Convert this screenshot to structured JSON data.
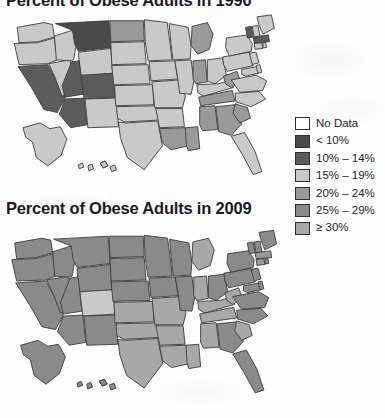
{
  "figure": {
    "maps": [
      {
        "id": "map-1990",
        "title": "Percent of Obese Adults in 1990",
        "year": "1990"
      },
      {
        "id": "map-2009",
        "title": "Percent of Obese Adults in 2009",
        "year": "2009"
      }
    ]
  },
  "legend": {
    "title": "",
    "items": [
      {
        "label": "No Data",
        "color": "#ffffff"
      },
      {
        "label": "< 10%",
        "color": "#4a4a4a"
      },
      {
        "label": "10% – 14%",
        "color": "#5c5c5c"
      },
      {
        "label": "15% – 19%",
        "color": "#c9c9c9"
      },
      {
        "label": "20% – 24%",
        "color": "#9a9a9a"
      },
      {
        "label": "25% – 29%",
        "color": "#8a8a8a"
      },
      {
        "label": "≥ 30%",
        "color": "#a8a8a8"
      }
    ]
  },
  "chart_data": {
    "type": "map",
    "subtitle": "",
    "xlabel": "",
    "ylabel": "",
    "projection": "united-states-choropleth",
    "legend_position": "right",
    "grid": false,
    "categories": [
      "No Data",
      "< 10%",
      "10% – 14%",
      "15% – 19%",
      "20% – 24%",
      "25% – 29%",
      "≥ 30%"
    ],
    "category_colors": [
      "#ffffff",
      "#4a4a4a",
      "#5c5c5c",
      "#c9c9c9",
      "#9a9a9a",
      "#8a8a8a",
      "#a8a8a8"
    ],
    "series": [
      {
        "name": "1990",
        "values": {
          "WA": "15% – 19%",
          "OR": "15% – 19%",
          "CA": "10% – 14%",
          "NV": "15% – 19%",
          "ID": "15% – 19%",
          "MT": "< 10%",
          "WY": "15% – 19%",
          "UT": "10% – 14%",
          "CO": "10% – 14%",
          "AZ": "10% – 14%",
          "NM": "15% – 19%",
          "ND": "20% – 24%",
          "SD": "15% – 19%",
          "NE": "15% – 19%",
          "KS": "15% – 19%",
          "OK": "15% – 19%",
          "TX": "15% – 19%",
          "MN": "15% – 19%",
          "IA": "15% – 19%",
          "MO": "15% – 19%",
          "AR": "15% – 19%",
          "LA": "20% – 24%",
          "WI": "15% – 19%",
          "IL": "15% – 19%",
          "MS": "20% – 24%",
          "MI": "20% – 24%",
          "IN": "20% – 24%",
          "KY": "15% – 19%",
          "TN": "20% – 24%",
          "AL": "20% – 24%",
          "OH": "15% – 19%",
          "WV": "20% – 24%",
          "GA": "20% – 24%",
          "FL": "15% – 19%",
          "SC": "20% – 24%",
          "NC": "15% – 19%",
          "VA": "15% – 19%",
          "PA": "15% – 19%",
          "NY": "15% – 19%",
          "MD": "15% – 19%",
          "DE": "15% – 19%",
          "NJ": "15% – 19%",
          "CT": "15% – 19%",
          "RI": "15% – 19%",
          "MA": "10% – 14%",
          "VT": "10% – 14%",
          "NH": "15% – 19%",
          "ME": "15% – 19%",
          "AK": "15% – 19%",
          "HI": "15% – 19%"
        }
      },
      {
        "name": "2009",
        "values": {
          "WA": "25% – 29%",
          "OR": "25% – 29%",
          "CA": "25% – 29%",
          "NV": "25% – 29%",
          "ID": "25% – 29%",
          "MT": "25% – 29%",
          "WY": "25% – 29%",
          "UT": "25% – 29%",
          "CO": "15% – 19%",
          "AZ": "25% – 29%",
          "NM": "25% – 29%",
          "ND": "25% – 29%",
          "SD": "25% – 29%",
          "NE": "25% – 29%",
          "KS": "≥ 30%",
          "OK": "≥ 30%",
          "TX": "≥ 30%",
          "MN": "25% – 29%",
          "IA": "25% – 29%",
          "MO": "≥ 30%",
          "AR": "≥ 30%",
          "LA": "≥ 30%",
          "WI": "25% – 29%",
          "IL": "25% – 29%",
          "MS": "≥ 30%",
          "MI": "≥ 30%",
          "IN": "≥ 30%",
          "KY": "≥ 30%",
          "TN": "≥ 30%",
          "AL": "≥ 30%",
          "OH": "25% – 29%",
          "WV": "≥ 30%",
          "GA": "25% – 29%",
          "FL": "25% – 29%",
          "SC": "≥ 30%",
          "NC": "25% – 29%",
          "VA": "25% – 29%",
          "PA": "25% – 29%",
          "NY": "25% – 29%",
          "MD": "25% – 29%",
          "DE": "25% – 29%",
          "NJ": "25% – 29%",
          "CT": "20% – 24%",
          "RI": "25% – 29%",
          "MA": "20% – 24%",
          "VT": "25% – 29%",
          "NH": "25% – 29%",
          "ME": "25% – 29%",
          "AK": "25% – 29%",
          "HI": "25% – 29%"
        }
      }
    ]
  }
}
